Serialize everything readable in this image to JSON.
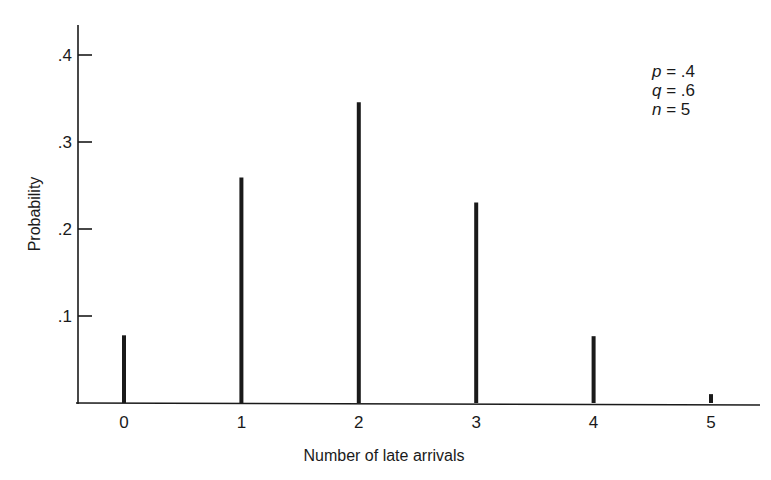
{
  "chart_data": {
    "type": "bar",
    "title": "",
    "xlabel": "Number of late arrivals",
    "ylabel": "Probability",
    "categories": [
      "0",
      "1",
      "2",
      "3",
      "4",
      "5"
    ],
    "values": [
      0.0778,
      0.2592,
      0.3456,
      0.2304,
      0.0768,
      0.0102
    ],
    "ylim": [
      0,
      0.43
    ],
    "yticks": [
      0.1,
      0.2,
      0.3,
      0.4
    ],
    "ytick_labels": [
      ".1",
      ".2",
      ".3",
      ".4"
    ],
    "grid": false,
    "legend": null,
    "style": "stem-lines",
    "annotations": [
      {
        "var": "p",
        "text": "p = .4",
        "value": ".4"
      },
      {
        "var": "q",
        "text": "q = .6",
        "value": ".6"
      },
      {
        "var": "n",
        "text": "n = 5",
        "value": "5"
      }
    ]
  },
  "colors": {
    "ink": "#1a1a1a",
    "background": "#ffffff"
  }
}
